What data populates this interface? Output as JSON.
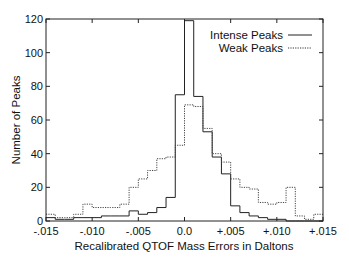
{
  "chart_data": {
    "type": "line",
    "style": "step-histogram",
    "title": "",
    "xlabel": "Recalibrated QTOF Mass Errors in Daltons",
    "ylabel": "Number of Peaks",
    "xlim": [
      -0.015,
      0.015
    ],
    "ylim": [
      0,
      120
    ],
    "x_ticks": [
      -0.015,
      -0.01,
      -0.005,
      0.0,
      0.005,
      0.01,
      0.015
    ],
    "x_tick_labels": [
      "-.015",
      "-.010",
      "-.005",
      "0.0",
      "+.005",
      "+.010",
      "+.015"
    ],
    "y_ticks": [
      0,
      20,
      40,
      60,
      80,
      100,
      120
    ],
    "y_tick_labels": [
      "0",
      "20",
      "40",
      "60",
      "80",
      "100",
      "120"
    ],
    "grid": false,
    "legend_position": "upper right",
    "bin_edges": [
      -0.015,
      -0.014,
      -0.013,
      -0.012,
      -0.011,
      -0.01,
      -0.009,
      -0.008,
      -0.007,
      -0.006,
      -0.005,
      -0.004,
      -0.003,
      -0.002,
      -0.001,
      0.0,
      0.001,
      0.002,
      0.003,
      0.004,
      0.005,
      0.006,
      0.007,
      0.008,
      0.009,
      0.01,
      0.011,
      0.012,
      0.013,
      0.014,
      0.015
    ],
    "series": [
      {
        "name": "Intense Peaks",
        "line_style": "solid",
        "values": [
          2,
          1,
          1,
          2,
          2,
          2,
          3,
          3,
          3,
          6,
          4,
          5,
          8,
          14,
          75,
          119,
          74,
          53,
          38,
          28,
          9,
          5,
          3,
          2,
          1,
          1,
          0,
          0,
          0,
          0
        ]
      },
      {
        "name": "Weak Peaks",
        "line_style": "dotted",
        "values": [
          4,
          2,
          2,
          4,
          10,
          8,
          8,
          8,
          10,
          20,
          25,
          30,
          37,
          38,
          45,
          69,
          68,
          55,
          40,
          35,
          25,
          20,
          19,
          11,
          10,
          11,
          20,
          3,
          1,
          4
        ]
      }
    ]
  },
  "legend": {
    "items": [
      {
        "label": "Intense Peaks",
        "style": "solid"
      },
      {
        "label": "Weak Peaks",
        "style": "dotted"
      }
    ]
  }
}
